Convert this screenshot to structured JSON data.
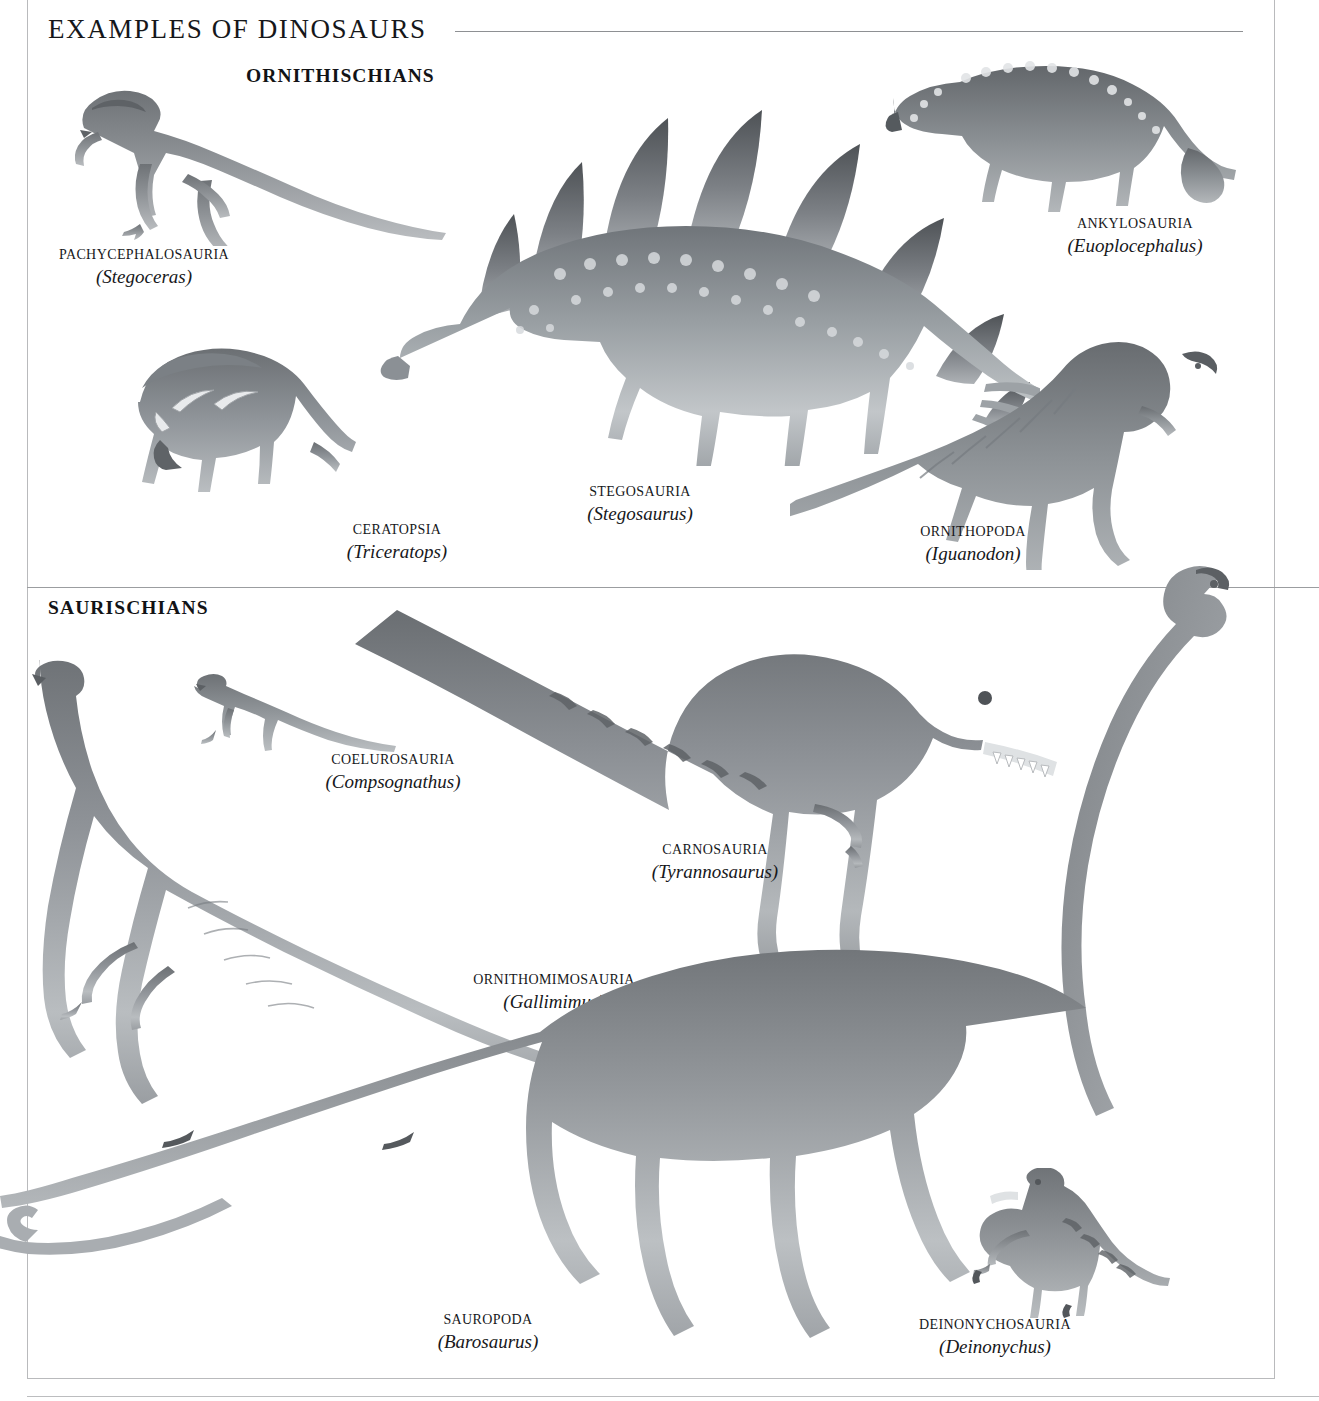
{
  "page": {
    "title": "EXAMPLES OF DINOSAURS",
    "background_color": "#ffffff",
    "rule_color": "#9b9da0",
    "text_color": "#17181b"
  },
  "sections": [
    {
      "id": "ornithischians",
      "heading": "ORNITHISCHIANS"
    },
    {
      "id": "saurischians",
      "heading": "SAURISCHIANS"
    }
  ],
  "specimens": [
    {
      "id": "pachycephalosauria",
      "section": "ornithischians",
      "group": "Pachycephalosauria",
      "genus": "(Stegoceras)",
      "image_name": "stegoceras-illustration"
    },
    {
      "id": "stegosauria",
      "section": "ornithischians",
      "group": "Stegosauria",
      "genus": "(Stegosaurus)",
      "image_name": "stegosaurus-illustration"
    },
    {
      "id": "ankylosauria",
      "section": "ornithischians",
      "group": "Ankylosauria",
      "genus": "(Euoplocephalus)",
      "image_name": "euoplocephalus-illustration"
    },
    {
      "id": "ceratopsia",
      "section": "ornithischians",
      "group": "Ceratopsia",
      "genus": "(Triceratops)",
      "image_name": "triceratops-illustration"
    },
    {
      "id": "ornithopoda",
      "section": "ornithischians",
      "group": "Ornithopoda",
      "genus": "(Iguanodon)",
      "image_name": "iguanodon-illustration"
    },
    {
      "id": "coelurosauria",
      "section": "saurischians",
      "group": "Coelurosauria",
      "genus": "(Compsognathus)",
      "image_name": "compsognathus-illustration"
    },
    {
      "id": "carnosauria",
      "section": "saurischians",
      "group": "Carnosauria",
      "genus": "(Tyrannosaurus)",
      "image_name": "tyrannosaurus-illustration"
    },
    {
      "id": "ornithomimosauria",
      "section": "saurischians",
      "group": "Ornithomimosauria",
      "genus": "(Gallimimus)",
      "image_name": "gallimimus-illustration"
    },
    {
      "id": "sauropoda",
      "section": "saurischians",
      "group": "Sauropoda",
      "genus": "(Barosaurus)",
      "image_name": "barosaurus-illustration"
    },
    {
      "id": "deinonychosauria",
      "section": "saurischians",
      "group": "Deinonychosauria",
      "genus": "(Deinonychus)",
      "image_name": "deinonychus-illustration"
    }
  ]
}
